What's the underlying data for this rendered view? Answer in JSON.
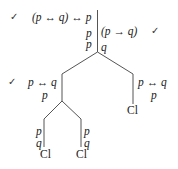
{
  "diagram": {
    "type": "truth-tree",
    "root": {
      "left_formulas": [
        "(p ↔ q) ↔ p",
        "p"
      ],
      "right_formulas": [
        "p",
        "(p → q)",
        "q"
      ],
      "checked": [
        "(p ↔ q) ↔ p",
        "(p → q)"
      ]
    },
    "branches": {
      "left": {
        "formulas": [
          "p ↔ q",
          "p"
        ],
        "checked": true,
        "branches": {
          "left": {
            "formulas": [
              "p",
              "q"
            ],
            "status": "Cl"
          },
          "right": {
            "formulas": [
              "p",
              "q"
            ],
            "status": "Cl"
          }
        }
      },
      "right": {
        "formulas": [
          "p ↔ q",
          "p"
        ],
        "status": "Cl"
      }
    },
    "labels": {
      "check": "✓",
      "closed": "Cl",
      "root_f1": "(p ↔ q) ↔ p",
      "root_f2": "p",
      "root_f3": "p",
      "root_f4": "(p → q)",
      "root_f5": "q",
      "left_f1": "p ↔ q",
      "left_f2": "p",
      "ll_f1": "p",
      "ll_f2": "q",
      "lr_f1": "p",
      "lr_f2": "q",
      "right_f1": "p ↔ q",
      "right_f2": "p"
    },
    "line_color": "#555555"
  }
}
